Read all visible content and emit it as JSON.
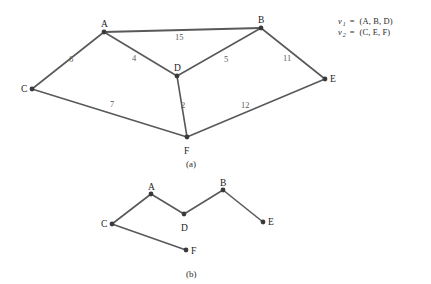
{
  "figure": {
    "panel_a": {
      "caption": "(a)",
      "type": "weighted-undirected-graph",
      "vertices": [
        {
          "id": "A",
          "label": "A",
          "x": 104,
          "y": 32,
          "label_dx": -3,
          "label_dy": -12
        },
        {
          "id": "B",
          "label": "B",
          "x": 261,
          "y": 28,
          "label_dx": -3,
          "label_dy": -12
        },
        {
          "id": "C",
          "label": "C",
          "x": 32,
          "y": 89,
          "label_dx": -11,
          "label_dy": -4
        },
        {
          "id": "D",
          "label": "D",
          "x": 177,
          "y": 76,
          "label_dx": -3,
          "label_dy": -12
        },
        {
          "id": "E",
          "label": "E",
          "x": 325,
          "y": 79,
          "label_dx": 5,
          "label_dy": -4
        },
        {
          "id": "F",
          "label": "F",
          "x": 187,
          "y": 137,
          "label_dx": -3,
          "label_dy": 10
        }
      ],
      "edges": [
        {
          "from": "A",
          "to": "B",
          "weight": "15",
          "label_x": 175,
          "label_y": 33,
          "thick": true
        },
        {
          "from": "A",
          "to": "C",
          "weight": "6",
          "label_x": 69,
          "label_y": 55,
          "thick": false
        },
        {
          "from": "A",
          "to": "D",
          "weight": "4",
          "label_x": 132,
          "label_y": 54,
          "thick": false
        },
        {
          "from": "B",
          "to": "D",
          "weight": "5",
          "label_x": 224,
          "label_y": 55,
          "thick": false
        },
        {
          "from": "B",
          "to": "E",
          "weight": "11",
          "label_x": 283,
          "label_y": 54,
          "thick": false
        },
        {
          "from": "C",
          "to": "F",
          "weight": "7",
          "label_x": 110,
          "label_y": 100,
          "thick": false
        },
        {
          "from": "D",
          "to": "F",
          "weight": "2",
          "label_x": 181,
          "label_y": 101,
          "thick": false
        },
        {
          "from": "E",
          "to": "F",
          "weight": "12",
          "label_x": 241,
          "label_y": 101,
          "thick": false
        }
      ],
      "caption_x": 186,
      "caption_y": 160
    },
    "panel_b": {
      "caption": "(b)",
      "type": "spanning-forest-graph",
      "vertices": [
        {
          "id": "A",
          "label": "A",
          "x": 151,
          "y": 194,
          "label_dx": -3,
          "label_dy": -11
        },
        {
          "id": "B",
          "label": "B",
          "x": 223,
          "y": 190,
          "label_dx": -3,
          "label_dy": -11
        },
        {
          "id": "C",
          "label": "C",
          "x": 112,
          "y": 224,
          "label_dx": -11,
          "label_dy": -4
        },
        {
          "id": "D",
          "label": "D",
          "x": 184,
          "y": 214,
          "label_dx": -3,
          "label_dy": 10
        },
        {
          "id": "E",
          "label": "E",
          "x": 263,
          "y": 222,
          "label_dx": 5,
          "label_dy": -4
        },
        {
          "id": "F",
          "label": "F",
          "x": 186,
          "y": 250,
          "label_dx": 5,
          "label_dy": -3
        }
      ],
      "edges": [
        {
          "from": "A",
          "to": "C"
        },
        {
          "from": "A",
          "to": "D"
        },
        {
          "from": "D",
          "to": "B"
        },
        {
          "from": "B",
          "to": "E"
        },
        {
          "from": "C",
          "to": "F"
        }
      ],
      "caption_x": 186,
      "caption_y": 270
    },
    "legend": {
      "rows": [
        {
          "var": "v",
          "sub": "1",
          "eq": "=",
          "set": "(A, B, D)"
        },
        {
          "var": "v",
          "sub": "2",
          "eq": "=",
          "set": "(C, E, F)"
        }
      ]
    },
    "colors": {
      "edge": "#58595b",
      "vertex": "#3a3a3c",
      "text": "#2b2b2b",
      "weight_text": "#5a5a5c",
      "background": "#ffffff"
    }
  }
}
